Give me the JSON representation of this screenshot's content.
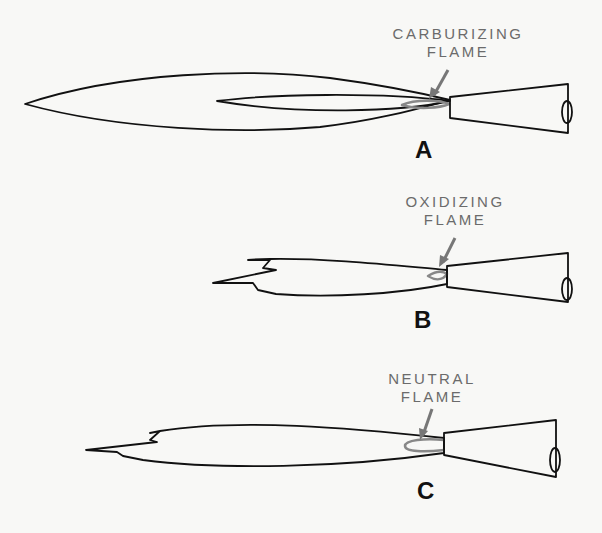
{
  "diagram": {
    "stroke_color": "#111111",
    "label_color": "#6b6b6b",
    "panels": [
      {
        "id": "A",
        "letter": "A",
        "label_line1": "CARBURIZING",
        "label_line2": "FLAME",
        "description": "Long outer envelope with elongated inner feather cone"
      },
      {
        "id": "B",
        "letter": "B",
        "label_line1": "OXIDIZING",
        "label_line2": "FLAME",
        "description": "Short flame with small pointed inner cone"
      },
      {
        "id": "C",
        "letter": "C",
        "label_line1": "NEUTRAL",
        "label_line2": "FLAME",
        "description": "Medium flame with rounded inner cone"
      }
    ]
  }
}
